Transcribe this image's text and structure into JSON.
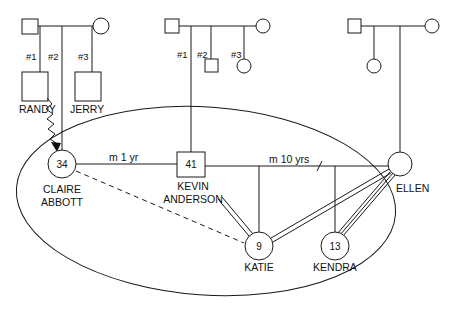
{
  "diagram": {
    "type": "genogram",
    "colors": {
      "line": "#1a1a1a",
      "background": "#ffffff",
      "text": "#111111"
    }
  },
  "families": {
    "claire_parents": {
      "children": [
        {
          "order": "#1",
          "name": "RANDY",
          "sex": "male"
        },
        {
          "order": "#2",
          "name": "CLAIRE ABBOTT",
          "sex": "female"
        },
        {
          "order": "#3",
          "name": "JERRY",
          "sex": "male"
        }
      ]
    },
    "kevin_parents": {
      "children": [
        {
          "order": "#1",
          "name": "KEVIN ANDERSON",
          "sex": "male"
        },
        {
          "order": "#2",
          "sex": "male"
        },
        {
          "order": "#3",
          "sex": "female"
        }
      ]
    },
    "ellen_parents": {
      "children": [
        {
          "sex": "female"
        },
        {
          "name": "ELLEN",
          "sex": "female"
        }
      ]
    }
  },
  "people": {
    "randy": {
      "name": "RANDY"
    },
    "jerry": {
      "name": "JERRY"
    },
    "claire": {
      "first": "CLAIRE",
      "last": "ABBOTT",
      "age": "34"
    },
    "kevin": {
      "first": "KEVIN",
      "last": "ANDERSON",
      "age": "41"
    },
    "ellen": {
      "name": "ELLEN"
    },
    "katie": {
      "name": "KATIE",
      "age": "9"
    },
    "kendra": {
      "name": "KENDRA",
      "age": "13"
    }
  },
  "relationships": {
    "claire_kevin": {
      "label": "m 1 yr",
      "type": "marriage"
    },
    "kevin_ellen": {
      "label": "m 10 yrs",
      "type": "marriage-divorced"
    },
    "randy_claire": {
      "type": "conflict/abuse (zigzag arrow)"
    },
    "claire_katie": {
      "type": "distant (dashed)"
    },
    "kevin_katie": {
      "type": "close (double line)"
    },
    "ellen_katie": {
      "type": "close (double line)"
    },
    "ellen_kendra": {
      "type": "very close (triple line)"
    }
  },
  "birth_order": {
    "left": [
      "#1",
      "#2",
      "#3"
    ],
    "middle": [
      "#1",
      "#2",
      "#3"
    ]
  },
  "household": {
    "type": "ellipse enclosing household members"
  }
}
